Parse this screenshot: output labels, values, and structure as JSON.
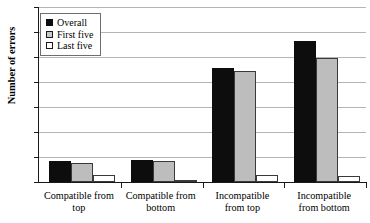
{
  "chart_data": {
    "type": "bar",
    "title": "",
    "xlabel": "",
    "ylabel": "Number of errors",
    "ylim": [
      0,
      7
    ],
    "ytick_labels": [
      "0",
      "1",
      "2",
      "3",
      "4",
      "5",
      "6",
      "7"
    ],
    "grid": true,
    "legend_position": "top-left",
    "categories": [
      "Compatible from top",
      "Compatible from bottom",
      "Incompatible from top",
      "Incompatible from bottom"
    ],
    "category_lines": [
      [
        "Compatible from",
        "top"
      ],
      [
        "Compatible from",
        "bottom"
      ],
      [
        "Incompatible",
        "from top"
      ],
      [
        "Incompatible",
        "from bottom"
      ]
    ],
    "series": [
      {
        "name": "Overall",
        "key": "overall",
        "color": "#0d0d0d",
        "values": [
          0.85,
          0.88,
          4.55,
          5.65
        ]
      },
      {
        "name": "First five",
        "key": "first-five",
        "color": "#bdbdbd",
        "values": [
          0.78,
          0.85,
          4.45,
          4.95
        ]
      },
      {
        "name": "Last five",
        "key": "last-five",
        "color": "#ffffff",
        "values": [
          0.28,
          0.02,
          0.28,
          0.25
        ]
      }
    ]
  },
  "legend": {
    "items": [
      {
        "label": "Overall",
        "key": "overall"
      },
      {
        "label": "First five",
        "key": "first-five"
      },
      {
        "label": "Last five",
        "key": "last-five"
      }
    ]
  }
}
